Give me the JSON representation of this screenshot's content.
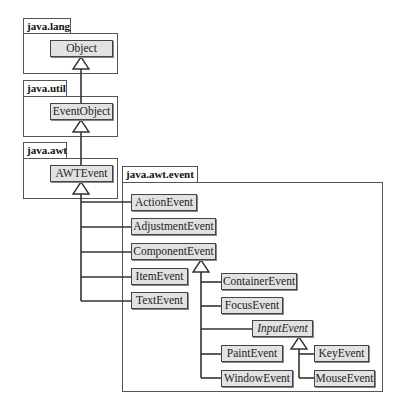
{
  "packages": [
    {
      "id": "java-lang",
      "label": "java.lang"
    },
    {
      "id": "java-util",
      "label": "java.util"
    },
    {
      "id": "java-awt",
      "label": "java.awt"
    },
    {
      "id": "java-awt-event",
      "label": "java.awt.event"
    }
  ],
  "classes": {
    "object": "Object",
    "event_object": "EventObject",
    "awt_event": "AWTEvent",
    "action_event": "ActionEvent",
    "adjustment_event": "AdjustmentEvent",
    "component_event": "ComponentEvent",
    "item_event": "ItemEvent",
    "text_event": "TextEvent",
    "container_event": "ContainerEvent",
    "focus_event": "FocusEvent",
    "input_event": "InputEvent",
    "paint_event": "PaintEvent",
    "window_event": "WindowEvent",
    "key_event": "KeyEvent",
    "mouse_event": "MouseEvent"
  },
  "abstract_classes": [
    "InputEvent"
  ],
  "inheritance": [
    {
      "child": "EventObject",
      "parent": "Object"
    },
    {
      "child": "AWTEvent",
      "parent": "EventObject"
    },
    {
      "child": "ActionEvent",
      "parent": "AWTEvent"
    },
    {
      "child": "AdjustmentEvent",
      "parent": "AWTEvent"
    },
    {
      "child": "ComponentEvent",
      "parent": "AWTEvent"
    },
    {
      "child": "ItemEvent",
      "parent": "AWTEvent"
    },
    {
      "child": "TextEvent",
      "parent": "AWTEvent"
    },
    {
      "child": "ContainerEvent",
      "parent": "ComponentEvent"
    },
    {
      "child": "FocusEvent",
      "parent": "ComponentEvent"
    },
    {
      "child": "InputEvent",
      "parent": "ComponentEvent"
    },
    {
      "child": "PaintEvent",
      "parent": "ComponentEvent"
    },
    {
      "child": "WindowEvent",
      "parent": "ComponentEvent"
    },
    {
      "child": "KeyEvent",
      "parent": "InputEvent"
    },
    {
      "child": "MouseEvent",
      "parent": "InputEvent"
    }
  ],
  "colors": {
    "class_fill": "#e2e2e2",
    "border": "#444444",
    "line": "#333333"
  }
}
